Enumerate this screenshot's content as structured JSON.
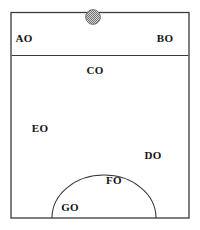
{
  "figure": {
    "type": "zone-diagram",
    "background_color": "#ffffff",
    "stroke_color": "#333333",
    "label_color": "#121212",
    "canvas": {
      "width": 200,
      "height": 230
    }
  },
  "shapes": {
    "outer_box": {
      "name": "outer-rectangle",
      "x": 11,
      "y": 12.5,
      "width": 178,
      "height": 205.5
    },
    "divider": {
      "name": "horizontal-divider",
      "x1": 11,
      "y1": 55.5,
      "x2": 189,
      "y2": 55.5
    },
    "arc": {
      "name": "semicircle-arc",
      "left_x": 52,
      "right_x": 156,
      "baseline_y": 218,
      "apex_y": 175,
      "radius_x": 52,
      "radius_y": 43
    },
    "marker_circle": {
      "name": "stippled-circle-marker",
      "cx": 93,
      "cy": 17,
      "r": 7.5,
      "fill_pattern": "checkered-gray",
      "fill_color": "#8c8c8c",
      "stroke_color": "#6e6e6e"
    }
  },
  "labels": [
    {
      "id": "AO",
      "text": "AO",
      "x": 24,
      "y": 38
    },
    {
      "id": "BO",
      "text": "BO",
      "x": 165,
      "y": 38
    },
    {
      "id": "CO",
      "text": "CO",
      "x": 95,
      "y": 70
    },
    {
      "id": "EO",
      "text": "EO",
      "x": 40,
      "y": 128
    },
    {
      "id": "DO",
      "text": "DO",
      "x": 153,
      "y": 155
    },
    {
      "id": "FO",
      "text": "FO",
      "x": 114,
      "y": 180
    },
    {
      "id": "GO",
      "text": "GO",
      "x": 70,
      "y": 207
    }
  ]
}
